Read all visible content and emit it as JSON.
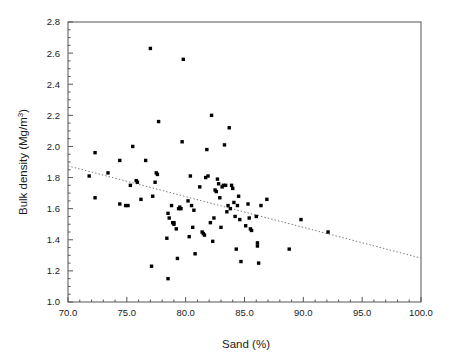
{
  "chart_data": {
    "type": "scatter",
    "title": "",
    "xlabel": "Sand  (%)",
    "ylabel": "Bulk density (Mg/m",
    "ylabel_sup": "3",
    "ylabel_tail": ")",
    "xlim": [
      70.0,
      100.0
    ],
    "ylim": [
      1.0,
      2.8
    ],
    "xticks": [
      70.0,
      75.0,
      80.0,
      85.0,
      90.0,
      95.0,
      100.0
    ],
    "xtick_labels": [
      "70.0",
      "75.0",
      "80.0",
      "85.0",
      "90.0",
      "95.0",
      "100.0"
    ],
    "yticks": [
      1.0,
      1.2,
      1.4,
      1.6,
      1.8,
      2.0,
      2.2,
      2.4,
      2.6,
      2.8
    ],
    "ytick_labels": [
      "1.0",
      "1.2",
      "1.4",
      "1.6",
      "1.8",
      "2.0",
      "2.2",
      "2.4",
      "2.6",
      "2.8"
    ],
    "xminor_step": 1.0,
    "yminor_step": 0.05,
    "grid": false,
    "legend": null,
    "marker_style": "filled-square",
    "marker_color": "#000000",
    "marker_size_px": 3.4,
    "trendline": {
      "style": "dotted",
      "color": "#777777",
      "x_start": 70.0,
      "y_start": 1.875,
      "x_end": 100.0,
      "y_end": 1.282
    },
    "series": [
      {
        "name": "Soil samples",
        "points": [
          [
            71.8,
            1.81
          ],
          [
            72.3,
            1.96
          ],
          [
            72.3,
            1.67
          ],
          [
            73.4,
            1.83
          ],
          [
            74.4,
            1.91
          ],
          [
            74.4,
            1.63
          ],
          [
            74.9,
            1.62
          ],
          [
            75.1,
            1.62
          ],
          [
            75.3,
            1.75
          ],
          [
            75.5,
            2.0
          ],
          [
            75.8,
            1.78
          ],
          [
            75.9,
            1.77
          ],
          [
            76.2,
            1.66
          ],
          [
            76.6,
            1.91
          ],
          [
            77.0,
            2.63
          ],
          [
            77.1,
            1.23
          ],
          [
            77.2,
            1.68
          ],
          [
            77.4,
            1.77
          ],
          [
            77.5,
            1.83
          ],
          [
            77.6,
            1.82
          ],
          [
            77.7,
            2.16
          ],
          [
            78.4,
            1.41
          ],
          [
            78.5,
            1.15
          ],
          [
            78.5,
            1.57
          ],
          [
            78.6,
            1.54
          ],
          [
            78.8,
            1.62
          ],
          [
            78.9,
            1.51
          ],
          [
            79.0,
            1.51
          ],
          [
            79.0,
            1.5
          ],
          [
            79.2,
            1.47
          ],
          [
            79.3,
            1.28
          ],
          [
            79.4,
            1.6
          ],
          [
            79.5,
            1.61
          ],
          [
            79.6,
            1.6
          ],
          [
            79.7,
            2.03
          ],
          [
            79.8,
            2.56
          ],
          [
            80.2,
            1.65
          ],
          [
            80.3,
            1.42
          ],
          [
            80.4,
            1.81
          ],
          [
            80.5,
            1.62
          ],
          [
            80.6,
            1.48
          ],
          [
            80.7,
            1.59
          ],
          [
            80.8,
            1.31
          ],
          [
            81.2,
            1.74
          ],
          [
            81.4,
            1.45
          ],
          [
            81.5,
            1.44
          ],
          [
            81.6,
            1.43
          ],
          [
            81.7,
            1.8
          ],
          [
            81.8,
            1.98
          ],
          [
            81.9,
            1.81
          ],
          [
            82.1,
            1.51
          ],
          [
            82.2,
            2.2
          ],
          [
            82.3,
            1.39
          ],
          [
            82.4,
            1.54
          ],
          [
            82.5,
            1.72
          ],
          [
            82.6,
            1.71
          ],
          [
            82.7,
            1.79
          ],
          [
            82.8,
            1.76
          ],
          [
            82.9,
            1.67
          ],
          [
            83.0,
            1.48
          ],
          [
            83.1,
            1.74
          ],
          [
            83.2,
            1.75
          ],
          [
            83.3,
            2.01
          ],
          [
            83.4,
            1.75
          ],
          [
            83.5,
            1.58
          ],
          [
            83.6,
            1.62
          ],
          [
            83.7,
            2.12
          ],
          [
            83.8,
            1.6
          ],
          [
            83.9,
            1.75
          ],
          [
            84.0,
            1.73
          ],
          [
            84.1,
            1.64
          ],
          [
            84.2,
            1.55
          ],
          [
            84.3,
            1.34
          ],
          [
            84.4,
            1.62
          ],
          [
            84.5,
            1.68
          ],
          [
            84.6,
            1.53
          ],
          [
            84.7,
            1.26
          ],
          [
            85.1,
            1.49
          ],
          [
            85.3,
            1.63
          ],
          [
            85.4,
            1.54
          ],
          [
            85.5,
            1.47
          ],
          [
            85.6,
            1.46
          ],
          [
            86.0,
            1.55
          ],
          [
            86.1,
            1.38
          ],
          [
            86.1,
            1.36
          ],
          [
            86.2,
            1.25
          ],
          [
            86.4,
            1.62
          ],
          [
            86.9,
            1.66
          ],
          [
            88.8,
            1.34
          ],
          [
            89.8,
            1.53
          ],
          [
            92.1,
            1.45
          ]
        ]
      }
    ]
  },
  "axes": {
    "left_px": 68,
    "right_px": 421,
    "top_px": 22,
    "bottom_px": 302
  }
}
